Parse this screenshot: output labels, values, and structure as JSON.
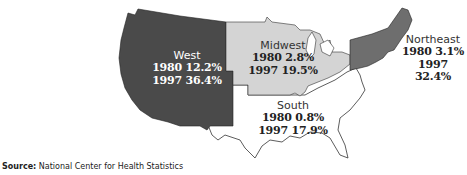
{
  "map": {
    "title_fragment": "",
    "colors": {
      "west": "#4a4a4a",
      "midwest": "#d4d4d4",
      "south": "#ffffff",
      "northeast": "#6e6e6e",
      "outline": "#333333"
    },
    "regions": [
      {
        "id": "west",
        "name": "West",
        "stat_1980": "1980 12.2%",
        "stat_1997": "1997 36.4%"
      },
      {
        "id": "midwest",
        "name": "Midwest",
        "stat_1980": "1980 2.8%",
        "stat_1997": "1997 19.5%"
      },
      {
        "id": "south",
        "name": "South",
        "stat_1980": "1980 0.8%",
        "stat_1997": "1997 17.9%"
      },
      {
        "id": "northeast",
        "name": "Northeast",
        "stat_1980": "1980 3.1%",
        "stat_1997": "1997 32.4%"
      }
    ]
  },
  "source": {
    "label": "Source:",
    "text": "National Center for Health Statistics"
  }
}
